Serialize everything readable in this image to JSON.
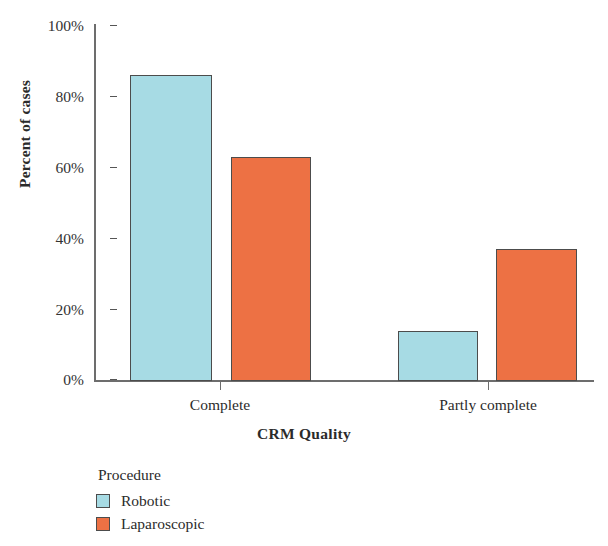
{
  "chart_data": {
    "type": "bar",
    "title": "",
    "categories": [
      "Complete",
      "Partly complete"
    ],
    "series": [
      {
        "name": "Robotic",
        "values": [
          86,
          63
        ],
        "color": "#a7dbe4"
      },
      {
        "name": "Laparoscopic",
        "values": [
          37.5,
          37.5
        ],
        "color": "#ed7144"
      }
    ],
    "xlabel": "CRM Quality",
    "ylabel": "Percent of cases",
    "ylim": [
      0,
      100
    ],
    "yticks": [
      0,
      20,
      40,
      60,
      80,
      100
    ],
    "ytick_labels": [
      "0%",
      "20%",
      "40%",
      "60%",
      "80%",
      "100%"
    ],
    "grid": false,
    "legend_title": "Procedure",
    "legend_position": "below-left"
  },
  "axes": {
    "y_title": "Percent of cases",
    "x_title": "CRM Quality",
    "y_tick_labels": [
      "100%",
      "80%",
      "60%",
      "40%",
      "20%",
      "0%"
    ],
    "x_tick_labels": [
      "Complete",
      "Partly complete"
    ]
  },
  "bars": [
    {
      "group": "Complete",
      "series": "Robotic",
      "value": 86,
      "value_label": "86%",
      "color": "#a7dbe4"
    },
    {
      "group": "Complete",
      "series": "Laparoscopic",
      "value": 63,
      "value_label": "63%",
      "color": "#ed7144"
    },
    {
      "group": "Partly complete",
      "series": "Robotic",
      "value": 14,
      "value_label": "14%",
      "color": "#a7dbe4"
    },
    {
      "group": "Partly complete",
      "series": "Laparoscopic",
      "value": 37,
      "value_label": "37%",
      "color": "#ed7144"
    }
  ],
  "legend": {
    "title": "Procedure",
    "items": [
      {
        "label": "Robotic",
        "color": "#a7dbe4"
      },
      {
        "label": "Laparoscopic",
        "color": "#ed7144"
      }
    ]
  },
  "colors": {
    "robotic": "#a7dbe4",
    "laparoscopic": "#ed7144",
    "axis": "#6d6d6d",
    "bar_border": "#4c4c4c",
    "text": "#2b2b2b",
    "background": "#ffffff"
  }
}
